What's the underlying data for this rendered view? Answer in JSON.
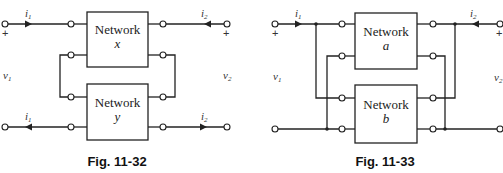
{
  "figures": [
    {
      "id": "fig-11-32",
      "caption": "Fig. 11-32",
      "networks": [
        {
          "label": "Network",
          "name": "x"
        },
        {
          "label": "Network",
          "name": "y"
        }
      ],
      "labels": {
        "i1_top": "i",
        "i1_top_sub": "1",
        "i1_bottom": "i",
        "i1_bottom_sub": "1",
        "i2_top": "i",
        "i2_top_sub": "2",
        "i2_bottom": "i",
        "i2_bottom_sub": "2",
        "v1": "v",
        "v1_sub": "1",
        "v2": "v",
        "v2_sub": "2",
        "plus_left": "+",
        "plus_right": "+"
      },
      "connection": "series"
    },
    {
      "id": "fig-11-33",
      "caption": "Fig. 11-33",
      "networks": [
        {
          "label": "Network",
          "name": "a"
        },
        {
          "label": "Network",
          "name": "b"
        }
      ],
      "labels": {
        "i1": "i",
        "i1_sub": "1",
        "i2": "i",
        "i2_sub": "2",
        "v1": "v",
        "v1_sub": "1",
        "v2": "v",
        "v2_sub": "2",
        "plus_left": "+",
        "plus_right": "+"
      },
      "connection": "parallel"
    }
  ]
}
